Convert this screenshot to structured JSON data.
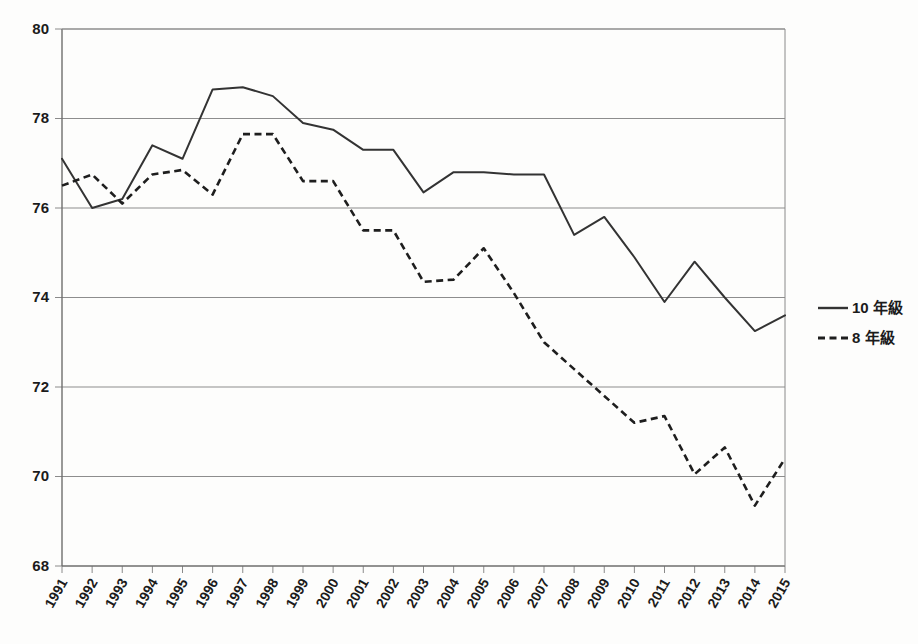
{
  "chart_data": {
    "type": "line",
    "title": "",
    "xlabel": "",
    "ylabel": "",
    "ylim": [
      68,
      80
    ],
    "ytick_step": 2,
    "yticks": [
      68,
      70,
      72,
      74,
      76,
      78,
      80
    ],
    "grid": true,
    "legend_position": "right",
    "categories": [
      "1991",
      "1992",
      "1993",
      "1994",
      "1995",
      "1996",
      "1997",
      "1998",
      "1999",
      "2000",
      "2001",
      "2002",
      "2003",
      "2004",
      "2005",
      "2006",
      "2007",
      "2008",
      "2009",
      "2010",
      "2011",
      "2012",
      "2013",
      "2014",
      "2015"
    ],
    "series": [
      {
        "name": "10 年級",
        "style": "solid",
        "color": "#333333",
        "values": [
          77.1,
          76.0,
          76.2,
          77.4,
          77.1,
          78.65,
          78.7,
          78.5,
          77.9,
          77.75,
          77.3,
          77.3,
          76.35,
          76.8,
          76.8,
          76.75,
          76.75,
          75.4,
          75.8,
          74.9,
          73.9,
          74.8,
          74.0,
          73.25,
          73.6
        ]
      },
      {
        "name": "8 年級",
        "style": "dashed",
        "color": "#1e1e1e",
        "values": [
          76.5,
          76.75,
          76.1,
          76.75,
          76.85,
          76.3,
          77.65,
          77.65,
          76.6,
          76.6,
          75.5,
          75.5,
          74.35,
          74.4,
          75.1,
          74.1,
          73.0,
          72.4,
          71.8,
          71.2,
          71.35,
          70.05,
          70.65,
          69.35,
          70.4
        ]
      }
    ]
  },
  "legend": {
    "entries": [
      {
        "label": "10 年級",
        "style": "solid"
      },
      {
        "label": "8 年級",
        "style": "dashed"
      }
    ]
  }
}
